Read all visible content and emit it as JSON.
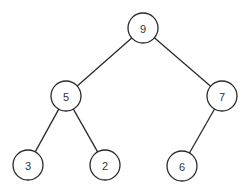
{
  "diagram": {
    "type": "binary-tree",
    "stroke_color": "#2a2a2a",
    "label_color": "#333333",
    "node_radius": 15,
    "nodes": [
      {
        "id": "n9",
        "label": "9",
        "x": 143,
        "y": 28
      },
      {
        "id": "n5",
        "label": "5",
        "x": 66,
        "y": 96
      },
      {
        "id": "n7",
        "label": "7",
        "x": 222,
        "y": 96
      },
      {
        "id": "n3",
        "label": "3",
        "x": 28,
        "y": 165
      },
      {
        "id": "n2",
        "label": "2",
        "x": 105,
        "y": 165
      },
      {
        "id": "n6",
        "label": "6",
        "x": 182,
        "y": 166
      }
    ],
    "edges": [
      {
        "from": "n9",
        "to": "n5"
      },
      {
        "from": "n9",
        "to": "n7"
      },
      {
        "from": "n5",
        "to": "n3"
      },
      {
        "from": "n5",
        "to": "n2"
      },
      {
        "from": "n7",
        "to": "n6"
      }
    ]
  }
}
